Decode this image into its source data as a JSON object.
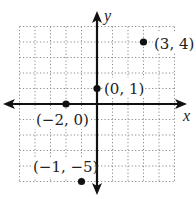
{
  "chart_data": {
    "type": "scatter",
    "title": "",
    "xlabel": "x",
    "ylabel": "y",
    "xlim": [
      -5,
      5
    ],
    "ylim": [
      -5,
      5
    ],
    "grid": true,
    "grid_style": "dotted",
    "points": [
      {
        "x": 3,
        "y": 4,
        "label": "(3, 4)"
      },
      {
        "x": 0,
        "y": 1,
        "label": "(0, 1)"
      },
      {
        "x": -2,
        "y": 0,
        "label": "(−2, 0)"
      },
      {
        "x": -1,
        "y": -5,
        "label": "(−1, −5)"
      }
    ],
    "colors": {
      "axis": "#111111",
      "grid": "#8a8a8a",
      "point": "#111111",
      "text": "#222222"
    }
  },
  "labels": {
    "x_axis": "x",
    "y_axis": "y",
    "p1": "(3, 4)",
    "p2": "(0, 1)",
    "p3": "(−2, 0)",
    "p4": "(−1, −5)"
  }
}
